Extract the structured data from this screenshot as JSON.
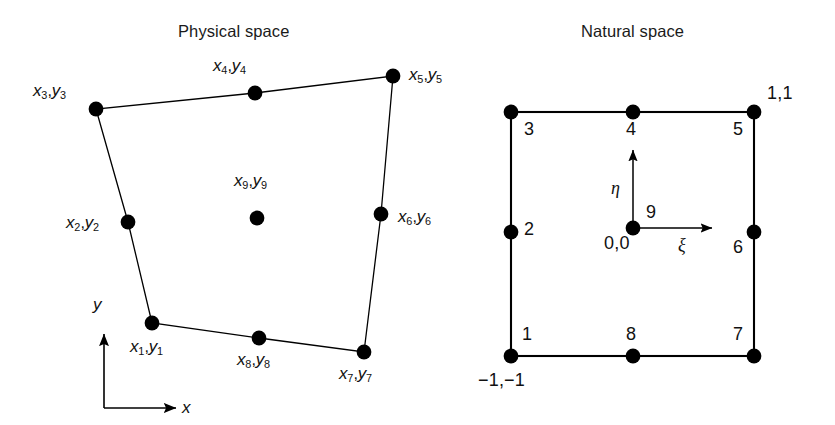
{
  "figure": {
    "background_color": "#ffffff",
    "stroke_color": "#000000",
    "node_color": "#000000"
  },
  "panels": {
    "physical": {
      "title": "Physical space",
      "title_pos": {
        "x": 178,
        "y": 22
      },
      "axes": {
        "origin": {
          "x": 104,
          "y": 408
        },
        "x_axis_label": "x",
        "x_axis_label_pos": {
          "x": 182,
          "y": 399
        },
        "x_axis_end": {
          "x": 176,
          "y": 408
        },
        "y_axis_label": "y",
        "y_axis_label_pos": {
          "x": 93,
          "y": 296
        },
        "y_axis_end": {
          "x": 104,
          "y": 334
        }
      },
      "nodes": [
        {
          "id": 1,
          "sub": "1",
          "x": 152,
          "y": 323,
          "label_x": 130,
          "label_y": 338,
          "corner": true
        },
        {
          "id": 2,
          "sub": "2",
          "x": 128,
          "y": 222,
          "label_x": 66,
          "label_y": 214,
          "corner": false
        },
        {
          "id": 3,
          "sub": "3",
          "x": 96,
          "y": 109,
          "label_x": 33,
          "label_y": 82,
          "corner": true
        },
        {
          "id": 4,
          "sub": "4",
          "x": 255,
          "y": 93,
          "label_x": 213,
          "label_y": 57,
          "corner": false
        },
        {
          "id": 5,
          "sub": "5",
          "x": 393,
          "y": 76,
          "label_x": 409,
          "label_y": 66,
          "corner": true
        },
        {
          "id": 6,
          "sub": "6",
          "x": 381,
          "y": 214,
          "label_x": 398,
          "label_y": 208,
          "corner": false
        },
        {
          "id": 7,
          "sub": "7",
          "x": 364,
          "y": 352,
          "label_x": 339,
          "label_y": 365,
          "corner": true
        },
        {
          "id": 8,
          "sub": "8",
          "x": 259,
          "y": 338,
          "label_x": 237,
          "label_y": 351,
          "corner": false
        },
        {
          "id": 9,
          "sub": "9",
          "x": 257,
          "y": 218,
          "label_x": 234,
          "label_y": 172,
          "corner": false
        }
      ],
      "outline_order": [
        1,
        2,
        3,
        4,
        5,
        6,
        7,
        8
      ],
      "label_prefix": "x",
      "label_second": "y"
    },
    "natural": {
      "title": "Natural space",
      "title_pos": {
        "x": 581,
        "y": 22
      },
      "axes": {
        "origin": {
          "x": 633,
          "y": 228
        },
        "xi_label": "ξ",
        "xi_label_pos": {
          "x": 678,
          "y": 236
        },
        "xi_end": {
          "x": 712,
          "y": 228
        },
        "eta_label": "η",
        "eta_label_pos": {
          "x": 611,
          "y": 179
        },
        "eta_end": {
          "x": 633,
          "y": 150
        },
        "origin_coord": "0,0",
        "origin_coord_pos": {
          "x": 604,
          "y": 234
        }
      },
      "square": {
        "left": 511,
        "top": 112,
        "right": 754,
        "bottom": 356
      },
      "nodes": [
        {
          "id": 1,
          "num": "1",
          "x": 511,
          "y": 356,
          "label_x": 522,
          "label_y": 325,
          "corner": true
        },
        {
          "id": 2,
          "num": "2",
          "x": 511,
          "y": 232,
          "label_x": 524,
          "label_y": 220,
          "corner": false
        },
        {
          "id": 3,
          "num": "3",
          "x": 511,
          "y": 112,
          "label_x": 524,
          "label_y": 120,
          "corner": true
        },
        {
          "id": 4,
          "num": "4",
          "x": 633,
          "y": 112,
          "label_x": 626,
          "label_y": 120,
          "corner": false
        },
        {
          "id": 5,
          "num": "5",
          "x": 754,
          "y": 112,
          "label_x": 733,
          "label_y": 120,
          "corner": true
        },
        {
          "id": 6,
          "num": "6",
          "x": 754,
          "y": 232,
          "label_x": 733,
          "label_y": 238,
          "corner": false
        },
        {
          "id": 7,
          "num": "7",
          "x": 754,
          "y": 356,
          "label_x": 733,
          "label_y": 325,
          "corner": true
        },
        {
          "id": 8,
          "num": "8",
          "x": 633,
          "y": 356,
          "label_x": 626,
          "label_y": 325,
          "corner": false
        },
        {
          "id": 9,
          "num": "9",
          "x": 633,
          "y": 228,
          "label_x": 646,
          "label_y": 203,
          "corner": false
        }
      ],
      "corner_coords": [
        {
          "text": "1,1",
          "x": 767,
          "y": 84
        },
        {
          "text": "−1,−1",
          "x": 478,
          "y": 371
        }
      ]
    }
  },
  "chart_data": {
    "type": "diagram",
    "panel_titles": [
      "Physical space",
      "Natural space"
    ],
    "node_count": 9,
    "physical_node_labels": [
      "x1,y1",
      "x2,y2",
      "x3,y3",
      "x4,y4",
      "x5,y5",
      "x6,y6",
      "x7,y7",
      "x8,y8",
      "x9,y9"
    ],
    "natural_node_labels": [
      "1",
      "2",
      "3",
      "4",
      "5",
      "6",
      "7",
      "8",
      "9"
    ],
    "natural_node_coordinates": [
      [
        -1,
        -1
      ],
      [
        -1,
        0
      ],
      [
        -1,
        1
      ],
      [
        0,
        1
      ],
      [
        1,
        1
      ],
      [
        1,
        0
      ],
      [
        1,
        -1
      ],
      [
        0,
        -1
      ],
      [
        0,
        0
      ]
    ],
    "physical_axis_labels": [
      "x",
      "y"
    ],
    "natural_axis_labels": [
      "ξ",
      "η"
    ],
    "natural_corner_annotations": [
      "1,1",
      "−1,−1",
      "0,0"
    ]
  }
}
